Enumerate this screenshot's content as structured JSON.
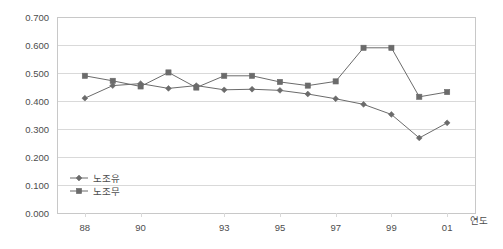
{
  "chart_data": {
    "type": "line",
    "title": "",
    "xlabel": "연도",
    "ylabel": "",
    "x": [
      "88",
      "89",
      "90",
      "91",
      "92",
      "93",
      "94",
      "95",
      "96",
      "97",
      "98",
      "99",
      "00",
      "01"
    ],
    "categories": [
      "88",
      "89",
      "90",
      "91",
      "92",
      "93",
      "94",
      "95",
      "96",
      "97",
      "98",
      "99",
      "00",
      "01"
    ],
    "xtick_labels": [
      "88",
      "90",
      "93",
      "95",
      "97",
      "99",
      "01"
    ],
    "xtick_indices": [
      0,
      2,
      5,
      7,
      9,
      11,
      13
    ],
    "ytick_labels": [
      "0.000",
      "0.100",
      "0.200",
      "0.300",
      "0.400",
      "0.500",
      "0.600",
      "0.700"
    ],
    "ytick_values": [
      0.0,
      0.1,
      0.2,
      0.3,
      0.4,
      0.5,
      0.6,
      0.7
    ],
    "ylim": [
      0.0,
      0.7
    ],
    "grid": true,
    "legend_position": "inside-bottom-left",
    "series": [
      {
        "name": "노조유",
        "marker": "diamond",
        "color": "#6b6b6b",
        "values": [
          0.41,
          0.455,
          0.462,
          0.445,
          0.455,
          0.44,
          0.442,
          0.438,
          0.425,
          0.408,
          0.388,
          0.352,
          0.268,
          0.35
        ]
      },
      {
        "name": "노조무",
        "marker": "square",
        "color": "#6b6b6b",
        "values": [
          0.49,
          0.472,
          0.452,
          0.502,
          0.448,
          0.49,
          0.49,
          0.468,
          0.455,
          0.47,
          0.59,
          0.59,
          0.415,
          0.465
        ]
      }
    ],
    "series_overrides": {
      "note": "last point of each series",
      "diamond_last": 0.322,
      "square_last": 0.432
    }
  },
  "legend": {
    "items": [
      {
        "label": "노조유",
        "marker": "diamond"
      },
      {
        "label": "노조무",
        "marker": "square"
      }
    ]
  },
  "axis": {
    "x_title": "연도"
  }
}
